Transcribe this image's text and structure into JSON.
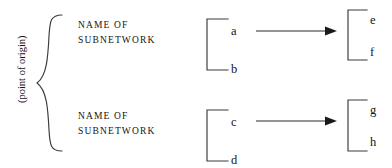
{
  "diagram": {
    "origin_label": "(point of origin)",
    "subnetworks": [
      {
        "name_line1": "NAME OF",
        "name_line2": "SUBNETWORK",
        "source_nodes": [
          "a",
          "b"
        ],
        "target_nodes": [
          "e",
          "f"
        ]
      },
      {
        "name_line1": "NAME OF",
        "name_line2": "SUBNETWORK",
        "source_nodes": [
          "c",
          "d"
        ],
        "target_nodes": [
          "g",
          "h"
        ]
      }
    ],
    "colors": {
      "ink": "#141414",
      "background": "#ffffff",
      "stroke": "#2b2b2b"
    }
  }
}
